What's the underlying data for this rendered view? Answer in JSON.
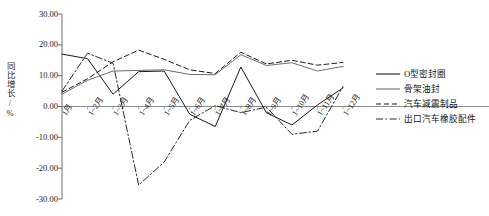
{
  "chart_data": {
    "type": "line",
    "title": "",
    "xlabel": "",
    "ylabel": "同比增长/%",
    "ylim": [
      -30,
      30
    ],
    "ytick_step": 10,
    "grid": false,
    "legend_position": "right",
    "yticks": [
      "30.00",
      "20.00",
      "10.00",
      "0.00",
      "-10.00",
      "-20.00",
      "-30.00"
    ],
    "ytick_values": [
      30,
      20,
      10,
      0,
      -10,
      -20,
      -30
    ],
    "categories": [
      "1月",
      "1~2月",
      "1~3月",
      "1~4月",
      "1~5月",
      "1~6月",
      "1~7月",
      "1~8月",
      "1~9月",
      "1~10月",
      "1~11月",
      "1~12月"
    ],
    "series": [
      {
        "name": "O型密封圈",
        "style": "solid",
        "color": "#1a1a1a",
        "values": [
          17.0,
          15.5,
          4.0,
          11.3,
          11.5,
          -2.5,
          -6.5,
          12.8,
          -2.0,
          -6.0,
          0.5,
          6.0
        ]
      },
      {
        "name": "骨架油封",
        "style": "solid",
        "color": "#6d6d6d",
        "values": [
          4.0,
          8.5,
          11.5,
          11.7,
          11.9,
          10.4,
          10.3,
          16.8,
          13.3,
          14.2,
          11.5,
          13.0
        ]
      },
      {
        "name": "汽车减震制品",
        "style": "dashed",
        "color": "#1a1a1a",
        "values": [
          4.6,
          9.0,
          14.5,
          18.3,
          15.3,
          11.9,
          10.7,
          17.6,
          13.8,
          15.0,
          13.4,
          14.3
        ]
      },
      {
        "name": "出口汽车橡胶配件",
        "style": "dashdot",
        "color": "#2a2a2a",
        "values": [
          5.0,
          17.3,
          14.0,
          -25.5,
          -18.0,
          -4.5,
          0.3,
          -2.0,
          -0.2,
          -9.0,
          -8.0,
          6.5
        ]
      }
    ]
  },
  "legend": {
    "items": [
      {
        "label": "O型密封圈",
        "style": "solid",
        "color": "#1a1a1a"
      },
      {
        "label": "骨架油封",
        "style": "solid",
        "color": "#6d6d6d"
      },
      {
        "label": "汽车减震制品",
        "style": "dashed",
        "color": "#1a1a1a"
      },
      {
        "label": "出口汽车橡胶配件",
        "style": "dashdot",
        "color": "#2a2a2a"
      }
    ]
  }
}
